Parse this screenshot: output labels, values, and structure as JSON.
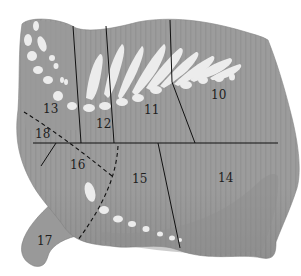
{
  "diagram": {
    "colors": {
      "meat": "#9a9a9a",
      "meat_light": "#a9a9a9",
      "bone": "#e9e9e9",
      "line": "#111111",
      "background": "#ffffff"
    },
    "regions": [
      {
        "id": "10",
        "label": "10",
        "x": 211,
        "y": 89
      },
      {
        "id": "11",
        "label": "11",
        "x": 144,
        "y": 104
      },
      {
        "id": "12",
        "label": "12",
        "x": 96,
        "y": 118
      },
      {
        "id": "13",
        "label": "13",
        "x": 43,
        "y": 103
      },
      {
        "id": "14",
        "label": "14",
        "x": 218,
        "y": 172
      },
      {
        "id": "15",
        "label": "15",
        "x": 132,
        "y": 173
      },
      {
        "id": "16",
        "label": "16",
        "x": 70,
        "y": 159
      },
      {
        "id": "17",
        "label": "17",
        "x": 37,
        "y": 235
      },
      {
        "id": "18",
        "label": "18",
        "x": 35,
        "y": 128
      }
    ]
  }
}
